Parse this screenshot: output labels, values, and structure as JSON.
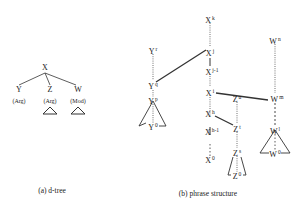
{
  "dtree": {
    "root": "X",
    "children": [
      {
        "label": "Y",
        "role": "(Arg)",
        "subtree": false
      },
      {
        "label": "Z",
        "role": "(Arg)",
        "subtree": true
      },
      {
        "label": "W",
        "role": "(Mod)",
        "subtree": true
      }
    ],
    "caption": "(a) d-tree"
  },
  "phrase": {
    "nodes": {
      "xk": {
        "base": "X",
        "sup": "k"
      },
      "xj": {
        "base": "X",
        "sup": "j"
      },
      "xj1": {
        "base": "X",
        "sup": "j-1"
      },
      "xi": {
        "base": "X",
        "sup": "i"
      },
      "xh": {
        "base": "X",
        "sup": "h"
      },
      "xh1": {
        "base": "X",
        "sup": "h-1"
      },
      "x0": {
        "base": "X",
        "sup": "0"
      },
      "yr": {
        "base": "Y",
        "sup": "r"
      },
      "yq": {
        "base": "Y",
        "sup": "q"
      },
      "yp": {
        "base": "Y",
        "sup": "p"
      },
      "y0": {
        "base": "Y",
        "sup": "0"
      },
      "zu": {
        "base": "Z",
        "sup": "u"
      },
      "zt": {
        "base": "Z",
        "sup": "t"
      },
      "zs": {
        "base": "Z",
        "sup": "s"
      },
      "z0": {
        "base": "Z",
        "sup": "0"
      },
      "wn": {
        "base": "W",
        "sup": "n"
      },
      "wm": {
        "base": "W",
        "sup": "m"
      },
      "wl": {
        "base": "W",
        "sup": "l"
      },
      "w0": {
        "base": "W",
        "sup": "0"
      }
    },
    "caption": "(b) phrase structure"
  }
}
